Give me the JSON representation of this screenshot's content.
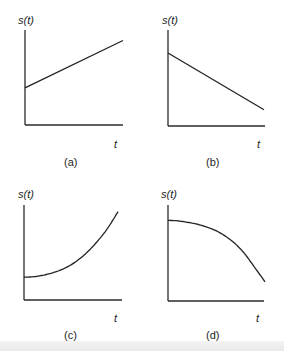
{
  "figure": {
    "title": "",
    "panels": [
      {
        "id": "a",
        "caption": "(a)",
        "ylabel": "s(t)",
        "xlabel": "t",
        "shape": "linear-increasing",
        "description": "Straight line starting above zero and increasing with t"
      },
      {
        "id": "b",
        "caption": "(b)",
        "ylabel": "s(t)",
        "xlabel": "t",
        "shape": "linear-decreasing",
        "description": "Straight line starting high and decreasing with t"
      },
      {
        "id": "c",
        "caption": "(c)",
        "ylabel": "s(t)",
        "xlabel": "t",
        "shape": "convex-increasing",
        "description": "Curve starting above zero, increasing at an accelerating rate"
      },
      {
        "id": "d",
        "caption": "(d)",
        "ylabel": "s(t)",
        "xlabel": "t",
        "shape": "concave-decreasing",
        "description": "Curve starting high, decreasing at an accelerating rate"
      }
    ]
  },
  "chart_data": [
    {
      "type": "line",
      "title": "(a)",
      "xlabel": "t",
      "ylabel": "s(t)",
      "x": [
        0,
        1
      ],
      "values": [
        0.39,
        0.89
      ],
      "xlim": [
        0,
        1
      ],
      "ylim": [
        0,
        1
      ],
      "grid": false
    },
    {
      "type": "line",
      "title": "(b)",
      "xlabel": "t",
      "ylabel": "s(t)",
      "x": [
        0,
        1
      ],
      "values": [
        0.76,
        0.17
      ],
      "xlim": [
        0,
        1
      ],
      "ylim": [
        0,
        1
      ],
      "grid": false
    },
    {
      "type": "line",
      "title": "(c)",
      "xlabel": "t",
      "ylabel": "s(t)",
      "x": [
        0,
        0.1,
        0.2,
        0.3,
        0.4,
        0.5,
        0.6,
        0.7,
        0.8,
        0.9,
        1.0
      ],
      "values": [
        0.24,
        0.245,
        0.26,
        0.285,
        0.32,
        0.37,
        0.44,
        0.53,
        0.64,
        0.77,
        0.93
      ],
      "xlim": [
        0,
        1
      ],
      "ylim": [
        0,
        1
      ],
      "grid": false
    },
    {
      "type": "line",
      "title": "(d)",
      "xlabel": "t",
      "ylabel": "s(t)",
      "x": [
        0,
        0.1,
        0.2,
        0.3,
        0.4,
        0.5,
        0.6,
        0.7,
        0.8,
        0.9,
        1.0
      ],
      "values": [
        0.84,
        0.835,
        0.82,
        0.8,
        0.77,
        0.73,
        0.67,
        0.59,
        0.48,
        0.34,
        0.2
      ],
      "xlim": [
        0,
        1
      ],
      "ylim": [
        0,
        1
      ],
      "grid": false
    }
  ]
}
